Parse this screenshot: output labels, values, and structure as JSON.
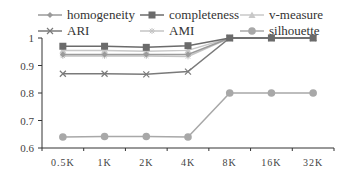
{
  "chart_data": {
    "type": "line",
    "title": "",
    "xlabel": "",
    "ylabel": "",
    "categories": [
      "0.5K",
      "1K",
      "2K",
      "4K",
      "8K",
      "16K",
      "32K"
    ],
    "ylim": [
      0.6,
      1.0
    ],
    "yticks": [
      "0.6",
      "0.7",
      "0.8",
      "0.9",
      "1"
    ],
    "grid": false,
    "legend_position": "top",
    "series": [
      {
        "name": "homogeneity",
        "color": "#9a9a9a",
        "marker": "diamond",
        "values": [
          0.94,
          0.94,
          0.94,
          0.94,
          1.0,
          1.0,
          1.0
        ]
      },
      {
        "name": "completeness",
        "color": "#6b6b6b",
        "marker": "square",
        "values": [
          0.97,
          0.97,
          0.966,
          0.972,
          1.0,
          1.0,
          1.0
        ]
      },
      {
        "name": "v-measure",
        "color": "#c8c8c8",
        "marker": "triangle",
        "values": [
          0.955,
          0.955,
          0.952,
          0.955,
          1.0,
          1.0,
          1.0
        ]
      },
      {
        "name": "ARI",
        "color": "#7a7a7a",
        "marker": "x",
        "values": [
          0.87,
          0.87,
          0.868,
          0.878,
          1.0,
          1.0,
          1.0
        ]
      },
      {
        "name": "AMI",
        "color": "#c4c4c4",
        "marker": "star",
        "values": [
          0.935,
          0.935,
          0.935,
          0.933,
          1.0,
          1.0,
          1.0
        ]
      },
      {
        "name": "silhouette",
        "color": "#a8a8a8",
        "marker": "circle",
        "values": [
          0.64,
          0.642,
          0.642,
          0.64,
          0.8,
          0.8,
          0.8
        ]
      }
    ]
  }
}
